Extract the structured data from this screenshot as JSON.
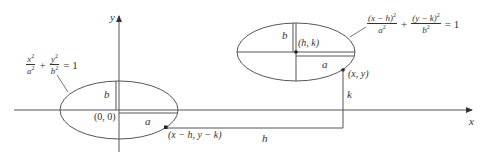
{
  "diagram": {
    "type": "ellipse-translation",
    "colors": {
      "stroke": "#555555",
      "text": "#333333",
      "background": "#ffffff"
    },
    "axes": {
      "x_label": "x",
      "y_label": "y"
    },
    "left_ellipse": {
      "equation": {
        "term1_num": "x",
        "term1_den": "a",
        "term2_num": "y",
        "term2_den": "b",
        "exp": "2",
        "plus": "+",
        "equals": "= 1"
      },
      "center_label": "(0, 0)",
      "semi_major_label": "a",
      "semi_minor_label": "b",
      "point_label": "(x − h, y − k)"
    },
    "right_ellipse": {
      "equation": {
        "term1_num": "(x − h)",
        "term1_den": "a",
        "term2_num": "(y − k)",
        "term2_den": "b",
        "exp": "2",
        "plus": "+",
        "equals": "= 1"
      },
      "center_label": "(h, k)",
      "semi_major_label": "a",
      "semi_minor_label": "b",
      "point_label": "(x, y)"
    },
    "translation": {
      "horizontal_label": "h",
      "vertical_label": "k"
    }
  }
}
